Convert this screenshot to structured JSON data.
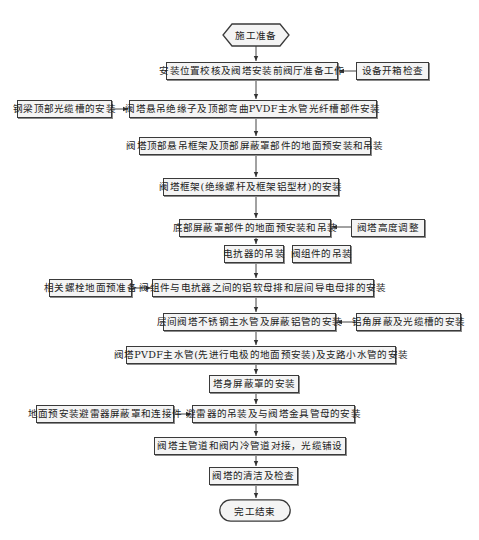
{
  "diagram": {
    "type": "flowchart",
    "start": {
      "id": "start",
      "label": "施工准备",
      "shape": "hexagon"
    },
    "main_steps": [
      {
        "id": "s1",
        "label": "安装位置校核及阀塔安装前阀厅准备工作"
      },
      {
        "id": "s2",
        "label": "阀塔悬吊绝缘子及顶部弯曲PVDF主水管光纤槽部件安装"
      },
      {
        "id": "s3",
        "label": "阀塔顶部悬吊框架及顶部屏蔽罩部件的地面预安装和吊装"
      },
      {
        "id": "s4",
        "label": "阀塔框架(绝缘螺杆及框架铝型材)的安装"
      },
      {
        "id": "s5",
        "label": "底部屏蔽罩部件的地面预安装和吊装"
      },
      {
        "id": "s6a",
        "label": "电抗器的吊装"
      },
      {
        "id": "s6b",
        "label": "阀组件的吊装"
      },
      {
        "id": "s7",
        "label": "阀组件与电抗器之间的铝软母排和层间导电母排的安装"
      },
      {
        "id": "s8",
        "label": "层间阀塔不锈钢主水管及屏蔽铝管的安装"
      },
      {
        "id": "s9",
        "label": "阀塔PVDF主水管(先进行电极的地面预安装)及支路小水管的安装"
      },
      {
        "id": "s10",
        "label": "塔身屏蔽罩的安装"
      },
      {
        "id": "s11",
        "label": "避雷器的吊装及与阀塔金具管母的安装"
      },
      {
        "id": "s12",
        "label": "阀塔主管道和阀内冷管道对接，光缆铺设"
      },
      {
        "id": "s13",
        "label": "阀塔的清洁及检查"
      }
    ],
    "side_steps": [
      {
        "id": "r1",
        "label": "设备开箱检查",
        "side": "right",
        "feeds": "s1"
      },
      {
        "id": "l1",
        "label": "钢梁顶部光缆槽的安装",
        "side": "left",
        "feeds": "s2"
      },
      {
        "id": "r2",
        "label": "阀塔高度调整",
        "side": "right",
        "feeds": "s5"
      },
      {
        "id": "l2",
        "label": "相关螺栓地面预准备",
        "side": "left",
        "feeds": "s7"
      },
      {
        "id": "r3",
        "label": "铝角屏蔽及光缆槽的安装",
        "side": "right",
        "feeds": "s8"
      },
      {
        "id": "l3",
        "label": "地面预安装避雷器屏蔽罩和连接件",
        "side": "left",
        "feeds": "s11"
      }
    ],
    "end": {
      "id": "end",
      "label": "完工结束",
      "shape": "rounded"
    },
    "colors": {
      "line": "#3a3a3a",
      "box_fill": "#f4f4f4",
      "background": "#ffffff"
    }
  }
}
